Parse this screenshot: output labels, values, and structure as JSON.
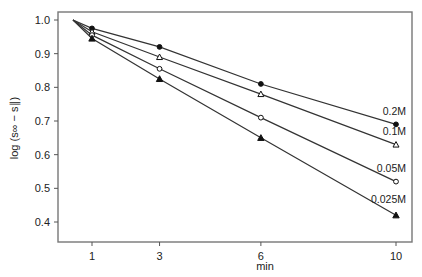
{
  "chart_data": {
    "type": "line",
    "title": "",
    "xlabel": "min",
    "ylabel": "log (s∞ − s∥)",
    "xlim": [
      0,
      10.5
    ],
    "ylim": [
      0.35,
      1.02
    ],
    "x_ticks": [
      1,
      3,
      6,
      10
    ],
    "y_ticks": [
      1.0,
      0.9,
      0.8,
      0.7,
      0.6,
      0.5,
      0.4
    ],
    "y_tick_labels": [
      "1.0",
      "0.9",
      "0.8",
      "0.7",
      "0.6",
      "0.5",
      "0.4"
    ],
    "x_tick_labels": [
      "1",
      "3",
      "6",
      "10"
    ],
    "grid": false,
    "legend": "inline labels at line ends",
    "origin_point": {
      "x": 0,
      "y": 1.0
    },
    "series": [
      {
        "name": "0.2M",
        "marker": "filled-circle",
        "x": [
          0,
          1,
          3,
          6,
          10
        ],
        "values": [
          1.0,
          0.975,
          0.92,
          0.81,
          0.69
        ]
      },
      {
        "name": "0.1M",
        "marker": "open-triangle",
        "x": [
          0,
          1,
          3,
          6,
          10
        ],
        "values": [
          1.0,
          0.965,
          0.89,
          0.78,
          0.63
        ]
      },
      {
        "name": "0.05M",
        "marker": "open-circle",
        "x": [
          0,
          1,
          3,
          6,
          10
        ],
        "values": [
          1.0,
          0.955,
          0.855,
          0.71,
          0.52
        ]
      },
      {
        "name": "0.025M",
        "marker": "filled-triangle",
        "x": [
          0,
          1,
          3,
          6,
          10
        ],
        "values": [
          1.0,
          0.945,
          0.825,
          0.65,
          0.42
        ]
      }
    ]
  }
}
